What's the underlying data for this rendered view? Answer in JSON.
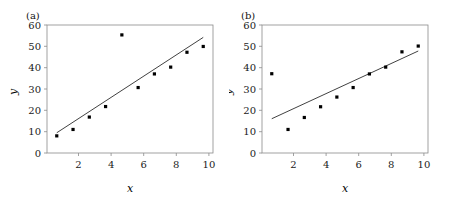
{
  "figure": {
    "panel_a_label": "(a)",
    "panel_b_label": "(b)",
    "xlabel": "x",
    "ylabel": "y"
  },
  "axes": {
    "x_ticks": [
      "2",
      "4",
      "6",
      "8",
      "10"
    ],
    "y_ticks": [
      "0",
      "10",
      "20",
      "30",
      "40",
      "50",
      "60"
    ]
  },
  "chart_data": [
    {
      "type": "scatter",
      "panel": "(a)",
      "title": "",
      "xlabel": "x",
      "ylabel": "y",
      "xlim": [
        0.4,
        10.6
      ],
      "ylim": [
        0,
        62
      ],
      "x_ticks": [
        2,
        4,
        6,
        8,
        10
      ],
      "y_ticks": [
        0,
        10,
        20,
        30,
        40,
        50,
        60
      ],
      "grid": false,
      "legend": "none",
      "x": [
        1,
        2,
        3,
        4,
        5,
        6,
        7,
        8,
        9,
        10
      ],
      "y": [
        8.3,
        11.4,
        17.4,
        22.5,
        57.2,
        31.7,
        38.3,
        41.6,
        48.8,
        51.6
      ],
      "outlier": {
        "x": 5,
        "y": 57.2
      },
      "fit_line": {
        "type": "linear-regression",
        "x_start": 1,
        "y_start": 9.8,
        "x_end": 10,
        "y_end": 56.0,
        "slope": 5.13,
        "intercept": 4.67
      }
    },
    {
      "type": "scatter",
      "panel": "(b)",
      "title": "",
      "xlabel": "x",
      "ylabel": "y",
      "xlim": [
        0.4,
        10.6
      ],
      "ylim": [
        0,
        62
      ],
      "x_ticks": [
        2,
        4,
        6,
        8,
        10
      ],
      "y_ticks": [
        0,
        10,
        20,
        30,
        40,
        50,
        60
      ],
      "grid": false,
      "legend": "none",
      "x": [
        1,
        2,
        3,
        4,
        5,
        6,
        7,
        8,
        9,
        10
      ],
      "y": [
        38.4,
        11.4,
        17.2,
        22.4,
        27.1,
        31.7,
        38.3,
        41.6,
        49.0,
        51.8
      ],
      "outlier": {
        "x": 1,
        "y": 38.4
      },
      "fit_line": {
        "type": "linear-regression",
        "x_start": 1,
        "y_start": 16.6,
        "x_end": 10,
        "y_end": 49.4,
        "slope": 3.64,
        "intercept": 12.95
      }
    }
  ]
}
